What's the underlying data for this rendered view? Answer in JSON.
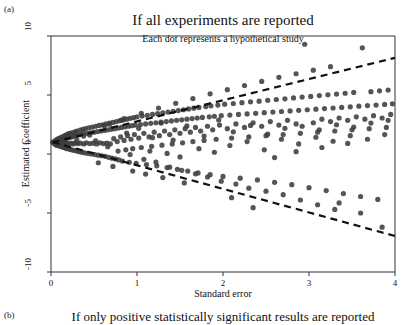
{
  "figure": {
    "panel_a_tag": "(a)",
    "panel_b_tag": "(b)",
    "next_panel_title": "If only positive statistically significant results are reported"
  },
  "chart_data": {
    "type": "scatter",
    "title": "If all experiments are reported",
    "subtitle": "Each dot represents a hypothetical study",
    "xlabel": "Standard error",
    "ylabel": "Estimated Coefficient",
    "xlim": [
      0,
      4
    ],
    "ylim": [
      -10,
      10
    ],
    "xticks": [
      0,
      1,
      2,
      3,
      4
    ],
    "xticklabels": [
      "0",
      "1",
      "2",
      "3",
      "4"
    ],
    "yticks": [
      10,
      5,
      0,
      -5,
      -10
    ],
    "yticklabels": [
      "10",
      "5",
      "0",
      "-5",
      "-10"
    ],
    "grid": false,
    "legend": null,
    "marker": {
      "color": "#3d3d3d",
      "size_px": 5.2,
      "shape": "circle",
      "opacity": 0.88
    },
    "reference_lines": [
      {
        "name": "upper-significance-boundary",
        "style": "dashed",
        "color": "#111111",
        "width_px": 2.2,
        "x": [
          0.02,
          4.0
        ],
        "y": [
          1.0,
          8.15
        ]
      },
      {
        "name": "lower-significance-boundary",
        "style": "dashed",
        "color": "#111111",
        "width_px": 2.2,
        "x": [
          0.02,
          4.0
        ],
        "y": [
          1.0,
          -6.95
        ]
      }
    ],
    "funnel": {
      "apex_x": 0.0,
      "apex_y": 1.0,
      "upper_slope": 1.79,
      "lower_slope": -1.99
    },
    "points": [
      [
        0.02,
        1.0
      ],
      [
        0.03,
        0.95
      ],
      [
        0.04,
        1.05
      ],
      [
        0.04,
        0.88
      ],
      [
        0.05,
        1.12
      ],
      [
        0.05,
        0.8
      ],
      [
        0.06,
        1.2
      ],
      [
        0.06,
        0.92
      ],
      [
        0.07,
        1.05
      ],
      [
        0.07,
        0.72
      ],
      [
        0.08,
        1.28
      ],
      [
        0.08,
        0.85
      ],
      [
        0.09,
        1.1
      ],
      [
        0.09,
        0.7
      ],
      [
        0.1,
        1.35
      ],
      [
        0.1,
        0.95
      ],
      [
        0.11,
        1.18
      ],
      [
        0.11,
        0.65
      ],
      [
        0.12,
        1.42
      ],
      [
        0.12,
        0.88
      ],
      [
        0.13,
        1.2
      ],
      [
        0.13,
        0.6
      ],
      [
        0.14,
        1.48
      ],
      [
        0.14,
        0.92
      ],
      [
        0.15,
        1.25
      ],
      [
        0.15,
        0.55
      ],
      [
        0.16,
        1.55
      ],
      [
        0.16,
        0.85
      ],
      [
        0.17,
        1.3
      ],
      [
        0.17,
        0.5
      ],
      [
        0.18,
        1.62
      ],
      [
        0.18,
        0.95
      ],
      [
        0.19,
        1.35
      ],
      [
        0.19,
        0.45
      ],
      [
        0.2,
        1.7
      ],
      [
        0.2,
        0.88
      ],
      [
        0.21,
        1.4
      ],
      [
        0.22,
        0.4
      ],
      [
        0.22,
        1.75
      ],
      [
        0.23,
        0.92
      ],
      [
        0.24,
        1.45
      ],
      [
        0.24,
        0.35
      ],
      [
        0.25,
        1.82
      ],
      [
        0.26,
        0.85
      ],
      [
        0.26,
        1.5
      ],
      [
        0.27,
        0.3
      ],
      [
        0.28,
        1.88
      ],
      [
        0.28,
        0.95
      ],
      [
        0.29,
        1.55
      ],
      [
        0.3,
        0.25
      ],
      [
        0.3,
        1.95
      ],
      [
        0.31,
        0.88
      ],
      [
        0.32,
        1.6
      ],
      [
        0.33,
        0.2
      ],
      [
        0.34,
        2.02
      ],
      [
        0.34,
        0.92
      ],
      [
        0.35,
        1.65
      ],
      [
        0.36,
        0.15
      ],
      [
        0.37,
        2.08
      ],
      [
        0.38,
        0.85
      ],
      [
        0.38,
        1.7
      ],
      [
        0.39,
        0.1
      ],
      [
        0.4,
        2.15
      ],
      [
        0.41,
        0.95
      ],
      [
        0.42,
        1.75
      ],
      [
        0.43,
        0.05
      ],
      [
        0.44,
        2.22
      ],
      [
        0.45,
        0.88
      ],
      [
        0.46,
        1.8
      ],
      [
        0.47,
        0.0
      ],
      [
        0.48,
        2.28
      ],
      [
        0.49,
        0.92
      ],
      [
        0.5,
        1.85
      ],
      [
        0.51,
        -0.05
      ],
      [
        0.52,
        2.35
      ],
      [
        0.53,
        0.85
      ],
      [
        0.54,
        1.9
      ],
      [
        0.55,
        -0.1
      ],
      [
        0.56,
        2.42
      ],
      [
        0.57,
        0.95
      ],
      [
        0.58,
        1.95
      ],
      [
        0.59,
        -0.15
      ],
      [
        0.6,
        2.48
      ],
      [
        0.61,
        0.88
      ],
      [
        0.62,
        2.0
      ],
      [
        0.63,
        -0.2
      ],
      [
        0.64,
        2.55
      ],
      [
        0.65,
        0.92
      ],
      [
        0.66,
        2.05
      ],
      [
        0.67,
        -0.28
      ],
      [
        0.68,
        2.62
      ],
      [
        0.69,
        0.85
      ],
      [
        0.7,
        2.1
      ],
      [
        0.71,
        -0.35
      ],
      [
        0.72,
        2.68
      ],
      [
        0.73,
        1.3
      ],
      [
        0.74,
        2.15
      ],
      [
        0.75,
        -0.42
      ],
      [
        0.76,
        2.75
      ],
      [
        0.77,
        1.05
      ],
      [
        0.78,
        2.2
      ],
      [
        0.79,
        -0.5
      ],
      [
        0.8,
        2.82
      ],
      [
        0.81,
        1.45
      ],
      [
        0.82,
        2.25
      ],
      [
        0.83,
        -0.6
      ],
      [
        0.84,
        2.88
      ],
      [
        0.85,
        1.15
      ],
      [
        0.86,
        2.3
      ],
      [
        0.87,
        0.35
      ],
      [
        0.88,
        2.95
      ],
      [
        0.89,
        1.55
      ],
      [
        0.9,
        2.35
      ],
      [
        0.91,
        -0.7
      ],
      [
        0.92,
        3.02
      ],
      [
        0.93,
        1.25
      ],
      [
        0.94,
        2.4
      ],
      [
        0.95,
        0.45
      ],
      [
        0.96,
        3.08
      ],
      [
        0.97,
        1.65
      ],
      [
        0.98,
        2.45
      ],
      [
        0.99,
        -0.8
      ],
      [
        1.0,
        3.15
      ],
      [
        1.02,
        1.35
      ],
      [
        1.04,
        2.5
      ],
      [
        1.05,
        0.55
      ],
      [
        1.06,
        3.22
      ],
      [
        1.08,
        1.75
      ],
      [
        1.1,
        2.55
      ],
      [
        1.11,
        -0.9
      ],
      [
        1.12,
        3.28
      ],
      [
        1.14,
        1.45
      ],
      [
        1.16,
        2.6
      ],
      [
        1.17,
        0.65
      ],
      [
        1.18,
        3.35
      ],
      [
        1.2,
        1.85
      ],
      [
        1.22,
        2.65
      ],
      [
        1.23,
        -1.0
      ],
      [
        1.24,
        3.42
      ],
      [
        1.26,
        1.55
      ],
      [
        1.28,
        2.7
      ],
      [
        1.29,
        0.75
      ],
      [
        1.3,
        3.48
      ],
      [
        1.32,
        1.95
      ],
      [
        1.34,
        2.75
      ],
      [
        1.35,
        -1.15
      ],
      [
        1.36,
        3.55
      ],
      [
        1.38,
        1.65
      ],
      [
        1.4,
        2.8
      ],
      [
        1.41,
        0.85
      ],
      [
        1.42,
        3.62
      ],
      [
        1.44,
        2.05
      ],
      [
        1.46,
        2.85
      ],
      [
        1.47,
        -1.3
      ],
      [
        1.48,
        3.68
      ],
      [
        1.5,
        1.75
      ],
      [
        1.52,
        2.9
      ],
      [
        1.53,
        0.95
      ],
      [
        1.54,
        3.75
      ],
      [
        1.56,
        2.15
      ],
      [
        1.58,
        2.95
      ],
      [
        1.59,
        -1.45
      ],
      [
        1.6,
        3.82
      ],
      [
        1.62,
        1.85
      ],
      [
        1.64,
        3.0
      ],
      [
        1.65,
        1.05
      ],
      [
        1.66,
        3.88
      ],
      [
        1.68,
        2.25
      ],
      [
        1.7,
        3.05
      ],
      [
        1.71,
        -1.6
      ],
      [
        1.72,
        3.95
      ],
      [
        1.74,
        1.95
      ],
      [
        1.76,
        3.1
      ],
      [
        1.78,
        1.15
      ],
      [
        1.8,
        4.02
      ],
      [
        1.82,
        2.35
      ],
      [
        1.84,
        3.15
      ],
      [
        1.85,
        -1.75
      ],
      [
        1.86,
        4.08
      ],
      [
        1.88,
        2.05
      ],
      [
        1.9,
        3.2
      ],
      [
        1.92,
        1.25
      ],
      [
        1.94,
        4.15
      ],
      [
        1.96,
        2.45
      ],
      [
        1.98,
        3.25
      ],
      [
        2.0,
        -1.9
      ],
      [
        2.02,
        4.22
      ],
      [
        2.05,
        2.15
      ],
      [
        2.08,
        3.3
      ],
      [
        2.1,
        1.35
      ],
      [
        2.12,
        4.28
      ],
      [
        2.15,
        2.55
      ],
      [
        2.18,
        3.35
      ],
      [
        2.2,
        -2.05
      ],
      [
        2.22,
        4.35
      ],
      [
        2.25,
        2.25
      ],
      [
        2.28,
        3.4
      ],
      [
        2.3,
        1.45
      ],
      [
        2.32,
        4.42
      ],
      [
        2.35,
        2.65
      ],
      [
        2.38,
        3.45
      ],
      [
        2.4,
        -2.2
      ],
      [
        2.42,
        4.48
      ],
      [
        2.45,
        2.35
      ],
      [
        2.48,
        3.5
      ],
      [
        2.5,
        1.55
      ],
      [
        2.52,
        4.55
      ],
      [
        2.55,
        2.75
      ],
      [
        2.58,
        3.55
      ],
      [
        2.6,
        -2.4
      ],
      [
        2.62,
        4.62
      ],
      [
        2.65,
        2.45
      ],
      [
        2.68,
        3.6
      ],
      [
        2.7,
        1.65
      ],
      [
        2.72,
        4.68
      ],
      [
        2.75,
        2.85
      ],
      [
        2.78,
        3.65
      ],
      [
        2.8,
        -2.6
      ],
      [
        2.82,
        4.75
      ],
      [
        2.85,
        2.55
      ],
      [
        2.88,
        3.7
      ],
      [
        2.9,
        1.75
      ],
      [
        2.92,
        4.82
      ],
      [
        2.95,
        9.3
      ],
      [
        2.98,
        3.75
      ],
      [
        3.0,
        -2.85
      ],
      [
        3.02,
        4.88
      ],
      [
        3.05,
        2.65
      ],
      [
        3.08,
        3.8
      ],
      [
        3.1,
        1.85
      ],
      [
        3.12,
        4.95
      ],
      [
        3.15,
        2.95
      ],
      [
        3.18,
        3.85
      ],
      [
        3.2,
        -3.1
      ],
      [
        3.22,
        5.02
      ],
      [
        3.25,
        2.75
      ],
      [
        3.28,
        3.9
      ],
      [
        3.3,
        1.95
      ],
      [
        3.32,
        5.08
      ],
      [
        3.35,
        3.05
      ],
      [
        3.38,
        3.95
      ],
      [
        3.4,
        -3.35
      ],
      [
        3.42,
        5.15
      ],
      [
        3.45,
        2.85
      ],
      [
        3.48,
        4.0
      ],
      [
        3.5,
        2.05
      ],
      [
        3.52,
        5.22
      ],
      [
        3.55,
        3.15
      ],
      [
        3.58,
        4.05
      ],
      [
        3.6,
        -3.6
      ],
      [
        3.62,
        9.0
      ],
      [
        3.65,
        2.95
      ],
      [
        3.68,
        4.1
      ],
      [
        3.7,
        2.15
      ],
      [
        3.72,
        5.28
      ],
      [
        3.75,
        3.25
      ],
      [
        3.78,
        4.15
      ],
      [
        3.8,
        -3.85
      ],
      [
        3.82,
        5.35
      ],
      [
        3.85,
        3.05
      ],
      [
        3.88,
        4.2
      ],
      [
        3.9,
        2.25
      ],
      [
        3.92,
        5.42
      ],
      [
        3.95,
        3.35
      ],
      [
        3.97,
        4.25
      ],
      [
        3.85,
        -6.2
      ],
      [
        3.6,
        -5.0
      ],
      [
        3.35,
        -4.15
      ],
      [
        2.35,
        -4.55
      ],
      [
        2.1,
        -3.7
      ],
      [
        1.3,
        -2.0
      ],
      [
        1.55,
        -2.45
      ],
      [
        0.95,
        -1.45
      ],
      [
        1.1,
        -1.7
      ],
      [
        0.72,
        -1.05
      ],
      [
        0.55,
        -0.75
      ],
      [
        2.6,
        -0.3
      ],
      [
        2.85,
        0.2
      ],
      [
        3.15,
        0.55
      ],
      [
        3.45,
        0.9
      ],
      [
        0.45,
        1.6
      ],
      [
        0.62,
        2.4
      ],
      [
        0.85,
        3.0
      ],
      [
        1.05,
        3.45
      ],
      [
        1.25,
        3.9
      ],
      [
        1.45,
        4.3
      ],
      [
        1.65,
        4.7
      ],
      [
        1.85,
        5.1
      ],
      [
        2.05,
        5.45
      ],
      [
        2.25,
        5.8
      ],
      [
        2.45,
        6.15
      ],
      [
        2.65,
        6.5
      ],
      [
        2.85,
        6.8
      ],
      [
        3.05,
        7.1
      ],
      [
        3.25,
        7.4
      ],
      [
        0.3,
        1.2
      ],
      [
        0.38,
        1.52
      ],
      [
        0.52,
        1.12
      ],
      [
        0.66,
        0.62
      ],
      [
        0.78,
        0.25
      ],
      [
        0.92,
        -0.05
      ],
      [
        1.08,
        -0.45
      ],
      [
        1.22,
        -0.68
      ],
      [
        1.38,
        -1.12
      ],
      [
        1.52,
        -1.38
      ],
      [
        1.68,
        -1.68
      ],
      [
        1.82,
        -1.95
      ],
      [
        1.98,
        -2.3
      ],
      [
        2.15,
        -2.55
      ],
      [
        2.3,
        -2.9
      ],
      [
        2.5,
        -3.15
      ],
      [
        2.7,
        -3.45
      ],
      [
        2.9,
        -3.9
      ],
      [
        3.1,
        -4.3
      ],
      [
        3.3,
        -4.7
      ],
      [
        1.72,
        0.45
      ],
      [
        1.9,
        0.15
      ],
      [
        2.08,
        0.72
      ],
      [
        2.28,
        1.05
      ],
      [
        2.48,
        0.35
      ],
      [
        2.68,
        1.25
      ],
      [
        2.88,
        0.85
      ],
      [
        3.08,
        1.42
      ],
      [
        3.28,
        1.08
      ],
      [
        3.48,
        1.55
      ],
      [
        3.68,
        1.25
      ],
      [
        3.88,
        1.65
      ],
      [
        1.15,
        0.25
      ],
      [
        1.35,
        0.05
      ],
      [
        1.5,
        -0.25
      ],
      [
        0.88,
        1.78
      ],
      [
        1.02,
        2.18
      ],
      [
        1.18,
        1.38
      ],
      [
        1.28,
        2.62
      ],
      [
        1.42,
        1.18
      ],
      [
        1.58,
        2.38
      ],
      [
        1.78,
        1.52
      ],
      [
        1.95,
        2.88
      ],
      [
        2.12,
        1.88
      ],
      [
        2.32,
        2.42
      ],
      [
        2.52,
        1.68
      ],
      [
        2.72,
        2.18
      ],
      [
        2.92,
        2.35
      ],
      [
        3.12,
        2.05
      ],
      [
        3.32,
        2.48
      ],
      [
        3.52,
        2.28
      ],
      [
        3.72,
        2.62
      ],
      [
        3.92,
        2.85
      ],
      [
        0.68,
        2.52
      ],
      [
        0.82,
        2.88
      ]
    ]
  }
}
